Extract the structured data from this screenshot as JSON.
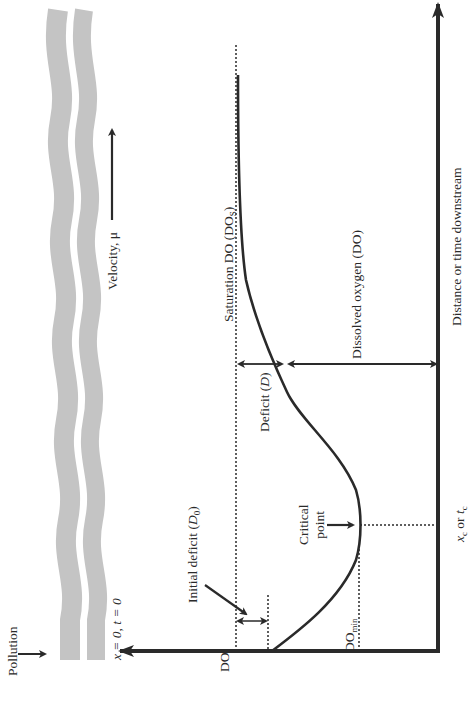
{
  "diagram": {
    "type": "dissolved-oxygen-sag-curve",
    "orientation": "rotated 90 degrees counterclockwise",
    "colors": {
      "river": "#c4c4c4",
      "ink": "#2a2a2a",
      "background": "#ffffff"
    },
    "labels": {
      "pollution": "Pollution",
      "origin": "x = 0, t = 0",
      "velocity": "Velocity, μ",
      "saturation": "Saturation DO (DO",
      "saturation_sub": "S",
      "saturation_end": ")",
      "initial_deficit": "Initial deficit (",
      "initial_deficit_var": "D",
      "initial_deficit_sub": "0",
      "initial_deficit_end": ")",
      "deficit": "Deficit (",
      "deficit_var": "D",
      "deficit_end": ")",
      "dissolved_oxygen": "Dissolved oxygen (DO)",
      "critical_line1": "Critical",
      "critical_line2": "point",
      "do_min": "DO",
      "do_min_sub": "min",
      "xc": "x",
      "xc_sub": "c",
      "xc_or": " or ",
      "tc": "t",
      "tc_sub": "c",
      "y_axis": "DO",
      "x_axis": "Distance or time downstream"
    }
  }
}
